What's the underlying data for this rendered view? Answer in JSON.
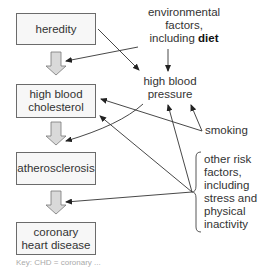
{
  "diagram": {
    "boxes": [
      {
        "id": "heredity",
        "label": "heredity"
      },
      {
        "id": "high-blood-cholesterol",
        "label": "high blood\ncholesterol"
      },
      {
        "id": "atherosclerosis",
        "label": "atherosclerosis"
      },
      {
        "id": "coronary-heart-disease",
        "label": "coronary\nheart disease"
      }
    ],
    "factors": {
      "environmental": {
        "line1": "environmental",
        "line2": "factors,",
        "line3_prefix": "including ",
        "line3_bold": "diet"
      },
      "high_blood_pressure": {
        "line1": "high blood",
        "line2": "pressure"
      },
      "smoking": "smoking",
      "other_risk": [
        "other risk",
        "factors,",
        "including",
        "stress and",
        "physical",
        "inactivity"
      ]
    },
    "colors": {
      "box_fill": "#f7f7f7",
      "box_border": "#6b6b6b",
      "block_arrow_fill": "#d9d9d9",
      "line": "#333333",
      "text": "#333333"
    },
    "footer_partial": "Key: CHD = coronary ..."
  }
}
